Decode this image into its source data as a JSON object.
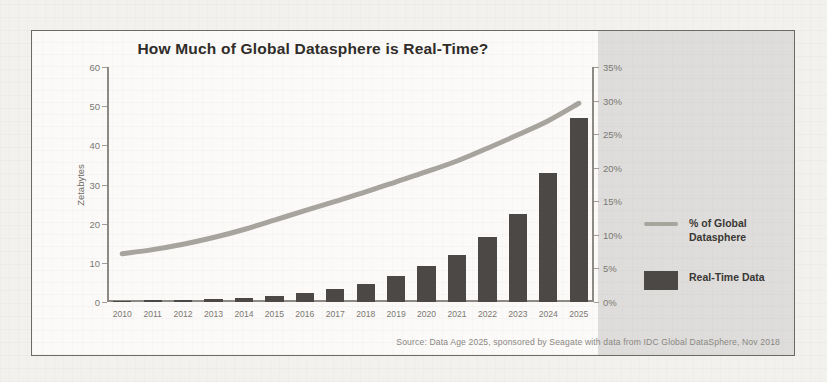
{
  "chart_data": {
    "type": "bar",
    "title": "How Much of Global Datasphere is Real-Time?",
    "categories": [
      "2010",
      "2011",
      "2012",
      "2013",
      "2014",
      "2015",
      "2016",
      "2017",
      "2018",
      "2019",
      "2020",
      "2021",
      "2022",
      "2023",
      "2024",
      "2025"
    ],
    "series": [
      {
        "name": "Real-Time Data",
        "type": "bar",
        "axis": "left",
        "unit": "Zetabytes",
        "color": "#4b4845",
        "values": [
          0.3,
          0.4,
          0.5,
          0.7,
          1.0,
          1.5,
          2.3,
          3.3,
          4.7,
          6.6,
          9.2,
          12.0,
          16.5,
          22.5,
          33.0,
          47.0
        ]
      },
      {
        "name": "% of Global Datasphere",
        "type": "line",
        "axis": "right",
        "unit": "%",
        "color": "#a7a39d",
        "values": [
          7.2,
          7.8,
          8.6,
          9.6,
          10.8,
          12.2,
          13.6,
          15.0,
          16.4,
          17.9,
          19.4,
          21.0,
          22.9,
          24.9,
          27.0,
          29.6
        ]
      }
    ],
    "xlabel": "",
    "ylabel": "Zetabytes",
    "ylim": [
      0,
      60
    ],
    "yticks": [
      0,
      10,
      20,
      30,
      40,
      50,
      60
    ],
    "y2label": "",
    "y2lim": [
      0,
      35
    ],
    "y2ticks": [
      "0%",
      "5%",
      "10%",
      "15%",
      "20%",
      "25%",
      "30%",
      "35%"
    ],
    "grid": false,
    "legend_position": "right"
  },
  "legend": {
    "items": [
      {
        "label": "% of Global Datasphere",
        "marker": "line",
        "color": "#a7a39d"
      },
      {
        "label": "Real-Time Data",
        "marker": "square",
        "color": "#4b4845"
      }
    ]
  },
  "footer": {
    "source": "Source: Data Age 2025, sponsored by Seagate with data from IDC Global DataSphere, Nov 2018"
  },
  "background_text": {
    "lines": [
      "ate volumes of data",
      "to produce",
      "of information",
      "and the",
      "data from",
      "systems"
    ]
  }
}
